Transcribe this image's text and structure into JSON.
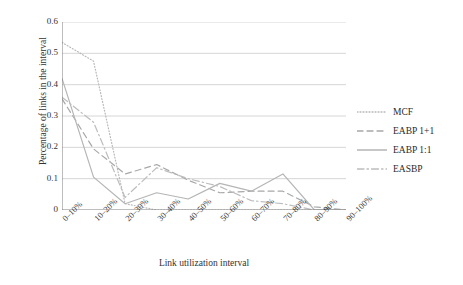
{
  "chart_data": {
    "type": "line",
    "title": "",
    "xlabel": "Link utilization interval",
    "ylabel": "Percentage of links in the interval",
    "categories": [
      "0–10%",
      "10–20%",
      "20–30%",
      "30–40%",
      "40–50%",
      "50–60%",
      "60–70%",
      "70–80%",
      "80–90%",
      "90–100%"
    ],
    "ylim": [
      0,
      0.6
    ],
    "yticks": [
      "0",
      "0.1",
      "0.2",
      "0.3",
      "0.4",
      "0.5",
      "0.6"
    ],
    "ytick_values": [
      0,
      0.1,
      0.2,
      0.3,
      0.4,
      0.5,
      0.6
    ],
    "grid": true,
    "legend_position": "right",
    "series": [
      {
        "name": "MCF",
        "style": "dotted",
        "color": "#b9b9b9",
        "values": [
          0.535,
          0.475,
          0.02,
          0.0,
          0.0,
          0.0,
          0.0,
          0.0,
          0.0,
          0.0
        ]
      },
      {
        "name": "EABP 1+1",
        "style": "dashed",
        "color": "#a8a8a8",
        "values": [
          0.355,
          0.195,
          0.115,
          0.145,
          0.095,
          0.055,
          0.06,
          0.06,
          0.01,
          0.0
        ]
      },
      {
        "name": "EABP 1:1",
        "style": "solid",
        "color": "#b5b5b5",
        "values": [
          0.42,
          0.105,
          0.02,
          0.055,
          0.035,
          0.085,
          0.06,
          0.115,
          0.0,
          0.0
        ]
      },
      {
        "name": "EASBP",
        "style": "dashdot",
        "color": "#bdbdbd",
        "values": [
          0.36,
          0.28,
          0.04,
          0.135,
          0.1,
          0.075,
          0.03,
          0.02,
          0.0,
          0.0
        ]
      }
    ]
  },
  "axis": {
    "line_color": "#808080",
    "grid_color": "#cccccc"
  }
}
